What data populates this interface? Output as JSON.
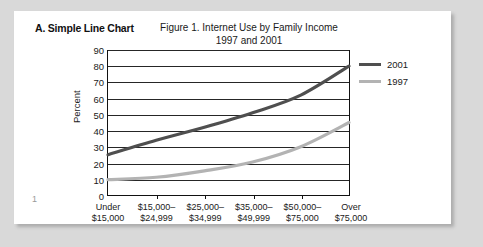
{
  "document": {
    "section_heading": "A. Simple Line Chart",
    "page_number": "1"
  },
  "colors": {
    "series_2001": "#4f4f4f",
    "series_1997": "#b3b3b3",
    "axis": "#111111",
    "grid": "#262626",
    "page_background": "#d9d9d9",
    "page_surface": "#ffffff"
  },
  "chart_data": {
    "type": "line",
    "title": "Figure 1. Internet Use by Family Income",
    "subtitle": "1997 and 2001",
    "xlabel": "",
    "ylabel": "Percent",
    "ylim": [
      0,
      90
    ],
    "yticks": [
      0,
      10,
      20,
      30,
      40,
      50,
      60,
      70,
      80,
      90
    ],
    "grid": true,
    "legend_position": "right",
    "categories": [
      "Under\n$15,000",
      "$15,000–\n$24,999",
      "$25,000–\n$34,999",
      "$35,000–\n$49,999",
      "$50,000–\n$75,000",
      "Over\n$75,000"
    ],
    "category_lines": [
      [
        "Under",
        "$15,000"
      ],
      [
        "$15,000–",
        "$24,999"
      ],
      [
        "$25,000–",
        "$34,999"
      ],
      [
        "$35,000–",
        "$49,999"
      ],
      [
        "$50,000–",
        "$75,000"
      ],
      [
        "Over",
        "$75,000"
      ]
    ],
    "series": [
      {
        "name": "2001",
        "color": "#4f4f4f",
        "values": [
          25,
          34,
          42,
          51,
          62,
          80
        ]
      },
      {
        "name": "1997",
        "color": "#b3b3b3",
        "values": [
          9.5,
          11,
          15,
          20.5,
          30,
          45
        ]
      }
    ]
  }
}
